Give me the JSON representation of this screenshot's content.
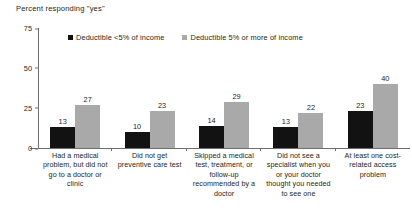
{
  "chart_data": {
    "type": "bar",
    "title": "Percent responding \"yes\"",
    "xlabel": "",
    "ylabel": "",
    "ylim": [
      0,
      75
    ],
    "yticks": [
      75,
      50,
      25,
      0
    ],
    "grid": false,
    "legend_position": "top",
    "categories": [
      "Had a medical problem, but did not go to a doctor or clinic",
      "Did not get preventive care test",
      "Skipped a medical test, treatment, or follow-up recommended by a doctor",
      "Did not see a specialist when you or your doctor thought you needed to see one",
      "At least one cost-related access problem"
    ],
    "series": [
      {
        "name": "Deductible <5% of income",
        "color": "#121212",
        "values": [
          13,
          10,
          14,
          13,
          23
        ]
      },
      {
        "name": "Deductible 5% or more of income",
        "color": "#a9a9a9",
        "values": [
          27,
          23,
          29,
          22,
          40
        ]
      }
    ]
  }
}
